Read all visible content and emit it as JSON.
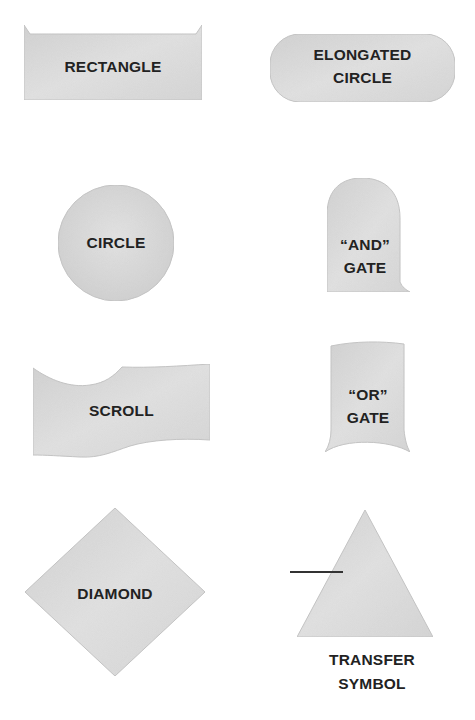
{
  "diagram": {
    "colors": {
      "background": "#ffffff",
      "shape_fill": "#dcdcdc",
      "shape_edge": "#bdbdbd",
      "text": "#222222",
      "line": "#333333"
    },
    "shapes": [
      {
        "id": "rectangle",
        "type": "rectangle",
        "label_lines": [
          "RECTANGLE"
        ]
      },
      {
        "id": "elongated-circle",
        "type": "stadium",
        "label_lines": [
          "ELONGATED",
          "CIRCLE"
        ]
      },
      {
        "id": "circle",
        "type": "circle",
        "label_lines": [
          "CIRCLE"
        ]
      },
      {
        "id": "and-gate",
        "type": "and-gate",
        "label_lines": [
          "“AND”",
          "GATE"
        ]
      },
      {
        "id": "scroll",
        "type": "scroll",
        "label_lines": [
          "SCROLL"
        ]
      },
      {
        "id": "or-gate",
        "type": "or-gate",
        "label_lines": [
          "“OR”",
          "GATE"
        ]
      },
      {
        "id": "diamond",
        "type": "diamond",
        "label_lines": [
          "DIAMOND"
        ]
      },
      {
        "id": "transfer-symbol",
        "type": "triangle",
        "label_lines": [
          "TRANSFER",
          "SYMBOL"
        ],
        "label_position": "below",
        "has_input_line": true
      }
    ]
  }
}
